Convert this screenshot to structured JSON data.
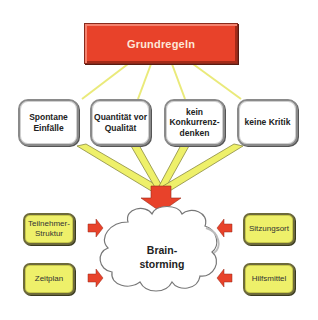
{
  "diagram": {
    "title": "Grundregeln",
    "rules": [
      {
        "label": "Spontane\nEinfälle"
      },
      {
        "label": "Quantität vor\nQualität"
      },
      {
        "label": "kein\nKonkurrenz-\ndenken"
      },
      {
        "label": "keine Kritik"
      }
    ],
    "center": {
      "label": "Brain-\nstorming"
    },
    "factors_left": [
      {
        "label": "Teilnehmer-\nStruktur"
      },
      {
        "label": "Zeitplan"
      }
    ],
    "factors_right": [
      {
        "label": "Sitzungsort"
      },
      {
        "label": "Hilfsmittel"
      }
    ],
    "colors": {
      "title_fill": "#e8422a",
      "connector": "#eef06a",
      "factor_fill": "#eef06a",
      "arrow": "#e8422a",
      "rule_fill": "#ffffff"
    }
  }
}
